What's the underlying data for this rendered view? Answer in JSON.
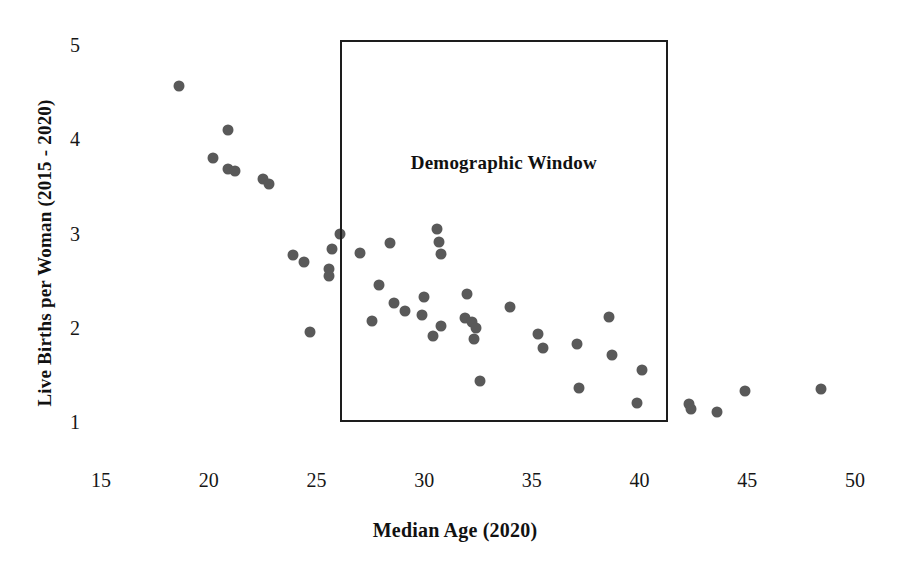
{
  "chart_data": {
    "type": "scatter",
    "title": "",
    "xlabel": "Median Age (2020)",
    "ylabel": "Live Births per Woman (2015 - 2020)",
    "xlim": [
      15,
      50
    ],
    "ylim": [
      1,
      5
    ],
    "xticks": [
      15,
      20,
      25,
      30,
      35,
      40,
      45,
      50
    ],
    "yticks": [
      1,
      2,
      3,
      4,
      5
    ],
    "xtick_labels": [
      "15",
      "20",
      "25",
      "30",
      "35",
      "40",
      "45",
      "50"
    ],
    "ytick_labels": [
      "1",
      "2",
      "3",
      "4",
      "5"
    ],
    "grid": false,
    "legend": null,
    "marker_color": "#595959",
    "marker_shape": "circle",
    "annotations": [
      {
        "name": "demographic-window",
        "label": "Demographic Window",
        "shape": "rectangle",
        "x_range": [
          26.1,
          41.3
        ],
        "y_range": [
          1.0,
          5.05
        ],
        "label_x": 33.7,
        "label_y": 3.75,
        "border_color": "#1d1d1d"
      }
    ],
    "points": [
      {
        "x": 18.6,
        "y": 4.56
      },
      {
        "x": 20.9,
        "y": 4.1
      },
      {
        "x": 20.2,
        "y": 3.8
      },
      {
        "x": 20.9,
        "y": 3.68
      },
      {
        "x": 21.2,
        "y": 3.66
      },
      {
        "x": 22.5,
        "y": 3.58
      },
      {
        "x": 22.8,
        "y": 3.52
      },
      {
        "x": 23.9,
        "y": 2.77
      },
      {
        "x": 24.4,
        "y": 2.7
      },
      {
        "x": 25.7,
        "y": 2.84
      },
      {
        "x": 25.6,
        "y": 2.62
      },
      {
        "x": 25.6,
        "y": 2.55
      },
      {
        "x": 26.1,
        "y": 3.0
      },
      {
        "x": 27.0,
        "y": 2.79
      },
      {
        "x": 24.7,
        "y": 1.95
      },
      {
        "x": 28.4,
        "y": 2.9
      },
      {
        "x": 27.9,
        "y": 2.45
      },
      {
        "x": 27.6,
        "y": 2.07
      },
      {
        "x": 28.6,
        "y": 2.26
      },
      {
        "x": 29.1,
        "y": 2.18
      },
      {
        "x": 29.9,
        "y": 2.13
      },
      {
        "x": 30.0,
        "y": 2.33
      },
      {
        "x": 30.4,
        "y": 1.91
      },
      {
        "x": 30.8,
        "y": 2.02
      },
      {
        "x": 30.6,
        "y": 3.05
      },
      {
        "x": 30.7,
        "y": 2.91
      },
      {
        "x": 30.8,
        "y": 2.78
      },
      {
        "x": 31.9,
        "y": 2.1
      },
      {
        "x": 32.0,
        "y": 2.36
      },
      {
        "x": 32.2,
        "y": 2.06
      },
      {
        "x": 32.4,
        "y": 2.0
      },
      {
        "x": 32.3,
        "y": 1.88
      },
      {
        "x": 32.6,
        "y": 1.44
      },
      {
        "x": 34.0,
        "y": 2.22
      },
      {
        "x": 35.3,
        "y": 1.93
      },
      {
        "x": 35.5,
        "y": 1.79
      },
      {
        "x": 37.1,
        "y": 1.83
      },
      {
        "x": 38.6,
        "y": 2.11
      },
      {
        "x": 38.7,
        "y": 1.71
      },
      {
        "x": 37.2,
        "y": 1.36
      },
      {
        "x": 40.1,
        "y": 1.55
      },
      {
        "x": 39.9,
        "y": 1.2
      },
      {
        "x": 42.3,
        "y": 1.19
      },
      {
        "x": 42.4,
        "y": 1.14
      },
      {
        "x": 43.6,
        "y": 1.11
      },
      {
        "x": 44.9,
        "y": 1.33
      },
      {
        "x": 48.4,
        "y": 1.35
      }
    ]
  },
  "axes": {
    "x_title": "Median Age (2020)",
    "y_title": "Live Births per Woman (2015 - 2020)"
  },
  "annotation": {
    "demographic_window_label": "Demographic Window"
  }
}
